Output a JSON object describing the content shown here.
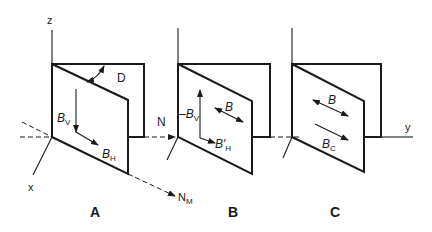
{
  "figure": {
    "panels": [
      {
        "id": "A",
        "label": "A"
      },
      {
        "id": "B",
        "label": "B"
      },
      {
        "id": "C",
        "label": "C"
      }
    ],
    "axes": {
      "z": "z",
      "x": "x",
      "y": "y"
    },
    "vectors": {
      "N": "N",
      "N_M": "N",
      "N_M_sub": "M",
      "D": "D"
    },
    "panel_A": {
      "B_V": "B",
      "B_V_sub": "V",
      "B_H": "B",
      "B_H_sub": "H"
    },
    "panel_B": {
      "neg_B_V": "–B",
      "neg_B_V_sub": "V",
      "B": "B",
      "B_H_prime": "B′",
      "B_H_prime_sub": "H"
    },
    "panel_C": {
      "B": "B",
      "B_C": "B",
      "B_C_sub": "C"
    }
  }
}
